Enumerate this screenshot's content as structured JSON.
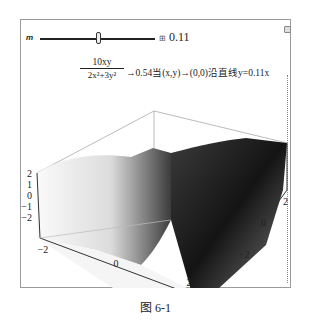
{
  "manipulate": {
    "slider": {
      "label": "m",
      "value_display": "0.11",
      "plus_icon": "⊞",
      "value": 0.11,
      "thumb_position_fraction": 0.62
    },
    "formula": {
      "numerator": "10xy",
      "denominator": "2x²+3y²",
      "text": "→0.54当(x,y)→(0,0)沿直线y=0.11x"
    },
    "plot3d": {
      "z_ticks": [
        "2",
        "1",
        "0",
        "−1",
        "−2"
      ],
      "x_ticks": [
        "−2",
        "0",
        "2"
      ],
      "y_ticks": [
        "−2",
        "0",
        "2"
      ],
      "surface_color_light": "#f2f2f2",
      "surface_color_dark": "#1a1a1a"
    }
  },
  "caption": "图 6-1"
}
